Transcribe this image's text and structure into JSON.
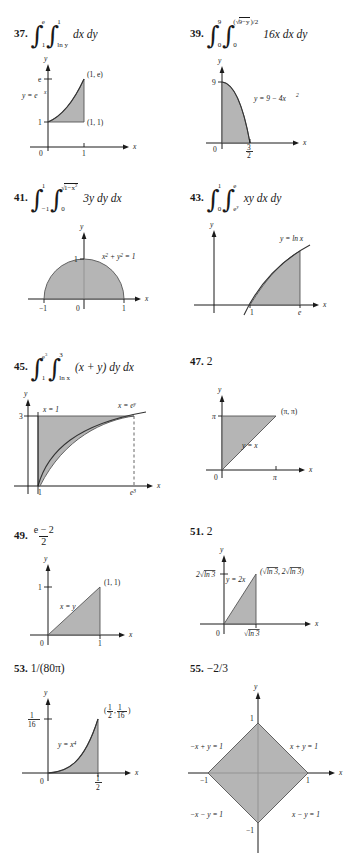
{
  "page": {
    "kind": "textbook-answer-key",
    "columns": 2
  },
  "problems": [
    {
      "number": "37.",
      "answer_type": "integral",
      "integral": {
        "outer_lower": "1",
        "outer_upper": "e",
        "inner_lower": "ln y",
        "inner_upper": "1",
        "integrand": "dx dy"
      },
      "figure": {
        "id": "fig37",
        "axis_x_label": "x",
        "axis_y_label": "y",
        "origin_label": "0",
        "x_ticks": [
          "1"
        ],
        "y_ticks": [
          "1",
          "e"
        ],
        "curve_label": "y = e^x",
        "points": [
          "(1, e)",
          "(1, 1)"
        ]
      }
    },
    {
      "number": "39.",
      "answer_type": "integral",
      "integral": {
        "outer_lower": "0",
        "outer_upper": "9",
        "inner_lower": "0",
        "inner_upper": "(√(9−y))/2",
        "integrand": "16x dx dy"
      },
      "figure": {
        "id": "fig39",
        "axis_x_label": "x",
        "axis_y_label": "y",
        "origin_label": "0",
        "x_ticks": [
          "3/2"
        ],
        "y_ticks": [
          "9"
        ],
        "curve_label": "y = 9 − 4x²",
        "points": []
      }
    },
    {
      "number": "41.",
      "answer_type": "integral",
      "integral": {
        "outer_lower": "−1",
        "outer_upper": "1",
        "inner_lower": "0",
        "inner_upper": "√(1−x²)",
        "integrand": "3y dy dx"
      },
      "figure": {
        "id": "fig41",
        "axis_x_label": "x",
        "axis_y_label": "y",
        "origin_label": "0",
        "x_ticks": [
          "−1",
          "1"
        ],
        "y_ticks": [
          "1"
        ],
        "curve_label": "x² + y² = 1",
        "points": []
      }
    },
    {
      "number": "43.",
      "answer_type": "integral",
      "integral": {
        "outer_lower": "0",
        "outer_upper": "1",
        "inner_lower": "e^y",
        "inner_upper": "e",
        "integrand": "xy dx dy"
      },
      "figure": {
        "id": "fig43",
        "axis_x_label": "x",
        "axis_y_label": "y",
        "origin_label": "",
        "x_ticks": [
          "1",
          "e"
        ],
        "y_ticks": [],
        "curve_label": "y = ln x",
        "points": []
      }
    },
    {
      "number": "45.",
      "answer_type": "integral",
      "integral": {
        "outer_lower": "1",
        "outer_upper": "e³",
        "inner_lower": "ln x",
        "inner_upper": "3",
        "integrand": "(x + y) dy dx"
      },
      "figure": {
        "id": "fig45",
        "axis_x_label": "x",
        "axis_y_label": "y",
        "origin_label": "",
        "x_ticks": [
          "1",
          "e³"
        ],
        "y_ticks": [
          "3"
        ],
        "curve_label": "x = e^y",
        "line_label": "x = 1",
        "points": []
      }
    },
    {
      "number": "47.",
      "answer_type": "value",
      "value": "2",
      "figure": {
        "id": "fig47",
        "axis_x_label": "x",
        "axis_y_label": "y",
        "origin_label": "0",
        "x_ticks": [
          "π"
        ],
        "y_ticks": [
          "π"
        ],
        "curve_label": "y = x",
        "points": [
          "(π, π)"
        ]
      }
    },
    {
      "number": "49.",
      "answer_type": "fraction",
      "value_num": "e − 2",
      "value_den": "2",
      "figure": {
        "id": "fig49",
        "axis_x_label": "x",
        "axis_y_label": "y",
        "origin_label": "0",
        "x_ticks": [
          "1"
        ],
        "y_ticks": [
          "1"
        ],
        "curve_label": "x = y",
        "points": [
          "(1, 1)"
        ]
      }
    },
    {
      "number": "51.",
      "answer_type": "value",
      "value": "2",
      "figure": {
        "id": "fig51",
        "axis_x_label": "x",
        "axis_y_label": "y",
        "origin_label": "0",
        "x_ticks": [
          "√ln 3"
        ],
        "y_ticks": [
          "2√ln 3"
        ],
        "curve_label": "y = 2x",
        "points": [
          "(√ln 3, 2√ln 3)"
        ]
      }
    },
    {
      "number": "53.",
      "answer_type": "value",
      "value": "1/(80π)",
      "figure": {
        "id": "fig53",
        "axis_x_label": "x",
        "axis_y_label": "y",
        "origin_label": "0",
        "x_ticks": [
          "1/2"
        ],
        "y_ticks": [
          "1/16"
        ],
        "curve_label": "y = x⁴",
        "points": [
          "(1/2, 1/16)"
        ]
      }
    },
    {
      "number": "55.",
      "answer_type": "value",
      "value": "−2/3",
      "figure": {
        "id": "fig55",
        "axis_x_label": "x",
        "axis_y_label": "y",
        "origin_label": "",
        "x_ticks": [
          "−1",
          "1"
        ],
        "y_ticks": [
          "−1",
          "1"
        ],
        "edge_labels": [
          "−x + y = 1",
          "x + y = 1",
          "−x − y = 1",
          "x − y = 1"
        ],
        "points": []
      }
    }
  ],
  "colors": {
    "shade": "#a8a8a8",
    "ink": "#1a1a1a",
    "curve": "#333333"
  }
}
